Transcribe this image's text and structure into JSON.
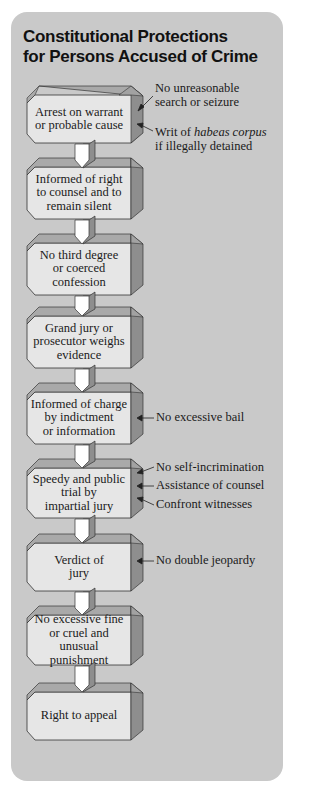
{
  "title": {
    "line1": "Constitutional Protections",
    "line2": "for Persons Accused of Crime"
  },
  "colors": {
    "panel": "#c9c9c9",
    "box_face": "#e6e6e6",
    "box_top": "#a9a9a9",
    "box_side": "#8e8e8e",
    "arrow": "#ffffff",
    "text": "#1a1a1a"
  },
  "steps": [
    {
      "lines": [
        "Arrest on warrant",
        "or probable cause"
      ]
    },
    {
      "lines": [
        "Informed of right",
        "to counsel and to",
        "remain silent"
      ]
    },
    {
      "lines": [
        "No third degree",
        "or coerced",
        "confession"
      ]
    },
    {
      "lines": [
        "Grand jury or",
        "prosecutor weighs",
        "evidence"
      ]
    },
    {
      "lines": [
        "Informed of charge",
        "by indictment",
        "or information"
      ]
    },
    {
      "lines": [
        "Speedy and public",
        "trial by",
        "impartial jury"
      ]
    },
    {
      "lines": [
        "Verdict of",
        "jury"
      ]
    },
    {
      "lines": [
        "No excessive fine",
        "or cruel and unusual",
        "punishment"
      ]
    },
    {
      "lines": [
        "Right to appeal"
      ]
    }
  ],
  "protections": {
    "arrest": [
      {
        "lines": [
          "No unreasonable",
          "search or seizure"
        ]
      },
      {
        "line1_pre": "Writ of ",
        "line1_italic": "habeas corpus",
        "line2": "if illegally  detained"
      }
    ],
    "charge": [
      {
        "text": "No excessive bail"
      }
    ],
    "trial": [
      {
        "text": "No self-incrimination"
      },
      {
        "text": "Assistance of counsel"
      },
      {
        "text": "Confront witnesses"
      }
    ],
    "verdict": [
      {
        "text": "No double jeopardy"
      }
    ]
  }
}
